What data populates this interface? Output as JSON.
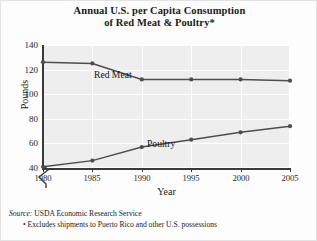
{
  "chart_data": {
    "type": "line",
    "title": "Annual U.S. per Capita Consumption of Red Meat & Poultry*",
    "title_line1": "Annual U.S. per Capita Consumption",
    "title_line2": "of Red Meat & Poultry*",
    "xlabel": "Year",
    "ylabel": "Pounds",
    "x": [
      1980,
      1985,
      1990,
      1995,
      2000,
      2005
    ],
    "xticklabels": [
      "1980",
      "1985",
      "1990",
      "1995",
      "2000",
      "2005"
    ],
    "yticks": [
      40,
      60,
      80,
      100,
      120,
      140
    ],
    "yticklabels": [
      "40",
      "60",
      "80",
      "100",
      "120",
      "140"
    ],
    "ylim": [
      40,
      140
    ],
    "xlim": [
      1980,
      2005
    ],
    "axis_break": true,
    "grid": true,
    "legend_position": "inline-labels",
    "series": [
      {
        "name": "Red Meat",
        "label": "Red Meat",
        "color": "#4d4d4d",
        "values": [
          126,
          125,
          112,
          112,
          112,
          111
        ]
      },
      {
        "name": "Poultry",
        "label": "Poultry",
        "color": "#4d4d4d",
        "values": [
          41,
          46,
          57,
          63,
          69,
          74
        ]
      }
    ]
  },
  "footnotes": {
    "source_word": "Source:",
    "source_text": " USDA Economic Research Service",
    "note": "• Excludes shipments to Puerto Rico and other U.S. possessions"
  }
}
